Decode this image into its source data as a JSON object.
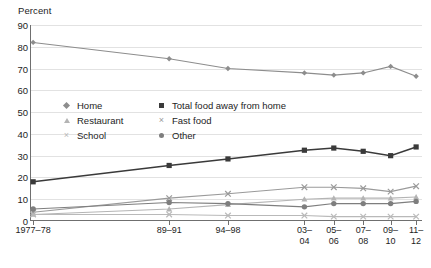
{
  "chart_data": {
    "type": "line",
    "title": "",
    "ylabel": "Percent",
    "xlabel": "",
    "ylim": [
      0,
      90
    ],
    "ytick_step": 10,
    "grid": true,
    "legend_position": "inside-upper-middle",
    "categories": [
      "1977–78",
      "89–91",
      "94–98",
      "03–04",
      "05–06",
      "07–08",
      "09–10",
      "11–12"
    ],
    "category_lines": [
      [
        "1977–78"
      ],
      [
        "89–91"
      ],
      [
        "94–98"
      ],
      [
        "03–",
        "04"
      ],
      [
        "05–",
        "06"
      ],
      [
        "07–",
        "08"
      ],
      [
        "09–",
        "10"
      ],
      [
        "11–",
        "12"
      ]
    ],
    "yticks": [
      0,
      10,
      20,
      30,
      40,
      50,
      60,
      70,
      80,
      90
    ],
    "series": [
      {
        "name": "Home",
        "marker": "diamond",
        "color": "#8d8d8d",
        "values": [
          82,
          74.5,
          70,
          68,
          67,
          68,
          71,
          66.5
        ]
      },
      {
        "name": "Total food away from home",
        "marker": "square",
        "color": "#3a3a3a",
        "values": [
          18,
          25.5,
          28.5,
          32.5,
          33.5,
          32,
          30,
          34
        ]
      },
      {
        "name": "Restaurant",
        "marker": "triangle",
        "color": "#b4b4b4",
        "values": [
          3,
          5.5,
          7.5,
          10,
          10.5,
          10.5,
          10.5,
          11
        ]
      },
      {
        "name": "Fast food",
        "marker": "x",
        "color": "#9a9a9a",
        "values": [
          4,
          10.5,
          12.5,
          15.5,
          15.5,
          15,
          13.5,
          16
        ]
      },
      {
        "name": "School",
        "marker": "x-light",
        "color": "#b9b9b9",
        "values": [
          3,
          3,
          2.5,
          2.5,
          2,
          2,
          2,
          2
        ]
      },
      {
        "name": "Other",
        "marker": "circle",
        "color": "#7e7e7e",
        "values": [
          5.5,
          8.5,
          8,
          6.5,
          8,
          8,
          8,
          9
        ]
      }
    ]
  },
  "legend": {
    "rows": [
      [
        {
          "label": "Home",
          "marker": "diamond"
        },
        {
          "label": "Total food away from home",
          "marker": "square"
        }
      ],
      [
        {
          "label": "Restaurant",
          "marker": "triangle"
        },
        {
          "label": "Fast food",
          "marker": "x"
        }
      ],
      [
        {
          "label": "School",
          "marker": "x-light"
        },
        {
          "label": "Other",
          "marker": "circle"
        }
      ]
    ]
  }
}
